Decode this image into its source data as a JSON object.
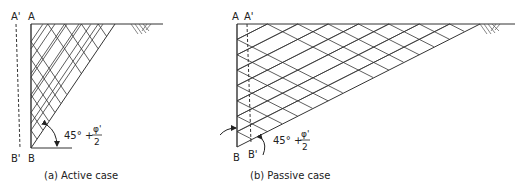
{
  "active": {
    "label_a": "A",
    "label_a_prime": "A'",
    "label_b": "B",
    "label_b_prime": "B'",
    "angle_label": "45° +",
    "angle_numerator": "φ'",
    "angle_denominator": "2",
    "caption": "(a) Active case"
  },
  "passive": {
    "label_a": "A",
    "label_a_prime": "A'",
    "label_b": "B",
    "label_b_prime": "B'",
    "angle_label": "45° +",
    "angle_numerator": "φ'",
    "angle_denominator": "2",
    "caption": "(b) Passive case"
  }
}
